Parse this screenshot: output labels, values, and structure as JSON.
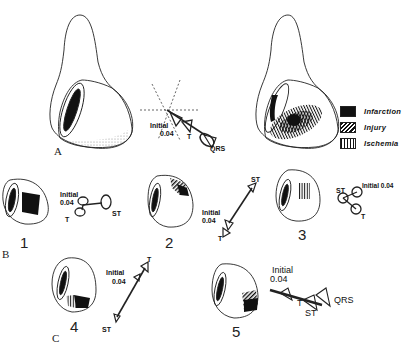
{
  "panels": {
    "A": {
      "letter": "A",
      "initial_label": "Initial",
      "initial_value": "0.04",
      "t_label": "T",
      "qrs_label": "QRS"
    },
    "B": {
      "letter": "B"
    },
    "C": {
      "letter": "C"
    }
  },
  "legend": {
    "items": [
      {
        "label": "Infarction",
        "pattern": "solid"
      },
      {
        "label": "Injury",
        "pattern": "diagonal-hatch"
      },
      {
        "label": "Ischemia",
        "pattern": "vertical-hatch"
      }
    ]
  },
  "sub_panels": [
    {
      "number": "1",
      "initial_label": "Initial",
      "initial_value": "0.04",
      "t_label": "T",
      "st_label": "ST"
    },
    {
      "number": "2",
      "initial_label": "Initial",
      "initial_value": "0.04",
      "t_label": "T",
      "st_label": "ST"
    },
    {
      "number": "3",
      "initial_label": "Initial 0.04",
      "t_label": "T",
      "st_label": "ST"
    },
    {
      "number": "4",
      "initial_label": "Initial",
      "initial_value": "0.04",
      "t_label": "T",
      "st_label": "ST"
    },
    {
      "number": "5",
      "initial_label": "Initial",
      "initial_value": "0.04",
      "t_label": "T",
      "st_label": "ST",
      "qrs_label": "QRS"
    }
  ],
  "colors": {
    "ink": "#111111",
    "background": "#ffffff"
  }
}
